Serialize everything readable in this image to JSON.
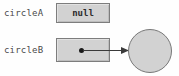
{
  "diagram": {
    "variables": [
      {
        "name": "circleA",
        "label": "circleA",
        "value_label": "null",
        "points_to": null
      },
      {
        "name": "circleB",
        "label": "circleB",
        "value_label": "",
        "points_to": "circle-object"
      }
    ],
    "heap_objects": [
      {
        "name": "circle-object",
        "shape": "circle",
        "label": ""
      }
    ],
    "colors": {
      "box_fill": "#d2d2d2",
      "box_border": "#7d7d7d",
      "circle_fill": "#d2d2d2",
      "circle_border": "#787878",
      "arrow": "#3a3a3a",
      "label_text": "#4a4a4a",
      "value_text": "#2b2b2b",
      "background": "#fefefe"
    },
    "icons": {
      "reference_dot": "reference-dot-icon",
      "arrow_head": "arrow-head-icon"
    }
  }
}
